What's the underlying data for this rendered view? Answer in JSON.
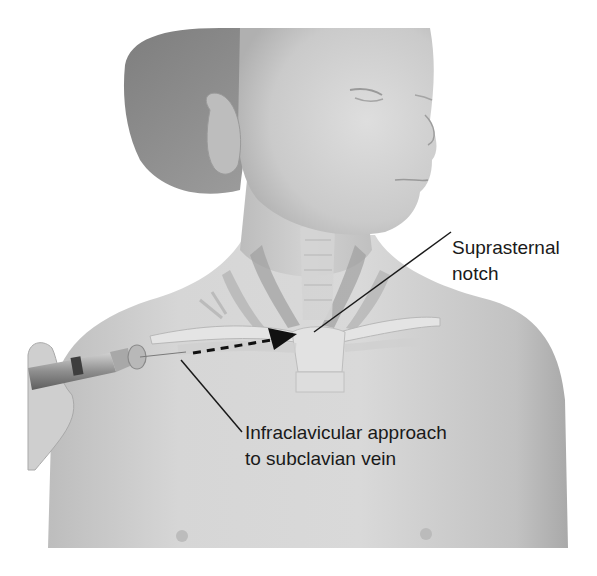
{
  "figure": {
    "style": "grayscale medical illustration"
  },
  "annotations": [
    {
      "id": "suprasternal-notch",
      "lines": [
        "Suprasternal",
        "notch"
      ]
    },
    {
      "id": "infraclavicular-approach",
      "lines": [
        "Infraclavicular approach",
        "to subclavian vein"
      ]
    }
  ],
  "colors": {
    "background": "#ffffff",
    "skin_light": "#dcdcdc",
    "skin_mid": "#c4c4c4",
    "skin_shadow": "#a8a8a8",
    "hair": "#8a8a8a",
    "text": "#1a1a1a",
    "arrow": "#111111"
  }
}
